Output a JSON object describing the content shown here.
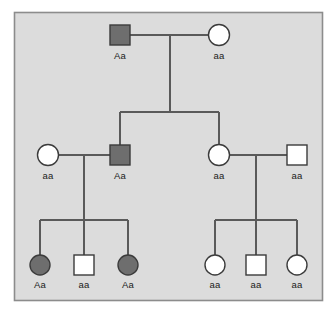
{
  "diagram": {
    "type": "pedigree",
    "frame": {
      "x": 14,
      "y": 12,
      "width": 308,
      "height": 288,
      "background_color": "#dcdcdc",
      "border_color": "#8c8c8c"
    },
    "colors": {
      "affected_fill": "#6e6e6e",
      "unaffected_fill": "#ffffff",
      "symbol_outline": "#3b3b3b",
      "line_color": "#5a5a5a",
      "label_color": "#1a1a1a"
    },
    "legend_note": "Filled symbol = affected (Aa shown shaded); open symbol = unaffected"
  },
  "generations": [
    {
      "id": "generation-1",
      "label": "I",
      "y": 35,
      "individuals": [
        {
          "id": "I-1",
          "sex": "male",
          "shape": "square",
          "affected": true,
          "genotype": "Aa",
          "x": 120,
          "y": 35
        },
        {
          "id": "I-2",
          "sex": "female",
          "shape": "circle",
          "affected": false,
          "genotype": "aa",
          "x": 219,
          "y": 35
        }
      ]
    },
    {
      "id": "generation-2",
      "label": "II",
      "y": 155,
      "individuals": [
        {
          "id": "II-1",
          "sex": "female",
          "shape": "circle",
          "affected": false,
          "genotype": "aa",
          "x": 48,
          "y": 155
        },
        {
          "id": "II-2",
          "sex": "male",
          "shape": "square",
          "affected": true,
          "genotype": "Aa",
          "x": 120,
          "y": 155
        },
        {
          "id": "II-3",
          "sex": "female",
          "shape": "circle",
          "affected": false,
          "genotype": "aa",
          "x": 219,
          "y": 155
        },
        {
          "id": "II-4",
          "sex": "male",
          "shape": "square",
          "affected": false,
          "genotype": "aa",
          "x": 297,
          "y": 155
        }
      ]
    },
    {
      "id": "generation-3",
      "label": "III",
      "y": 265,
      "individuals": [
        {
          "id": "III-1",
          "sex": "female",
          "shape": "circle",
          "affected": true,
          "genotype": "Aa",
          "x": 40,
          "y": 265
        },
        {
          "id": "III-2",
          "sex": "male",
          "shape": "square",
          "affected": false,
          "genotype": "aa",
          "x": 84,
          "y": 265
        },
        {
          "id": "III-3",
          "sex": "female",
          "shape": "circle",
          "affected": true,
          "genotype": "Aa",
          "x": 128,
          "y": 265
        },
        {
          "id": "III-4",
          "sex": "female",
          "shape": "circle",
          "affected": false,
          "genotype": "aa",
          "x": 215,
          "y": 265
        },
        {
          "id": "III-5",
          "sex": "male",
          "shape": "square",
          "affected": false,
          "genotype": "aa",
          "x": 256,
          "y": 265
        },
        {
          "id": "III-6",
          "sex": "female",
          "shape": "circle",
          "affected": false,
          "genotype": "aa",
          "x": 297,
          "y": 265
        }
      ]
    }
  ],
  "matings": [
    {
      "id": "mating-1",
      "partners": [
        "I-1",
        "I-2"
      ],
      "line_y": 35,
      "x1": 130,
      "x2": 210,
      "drop_x": 170,
      "drop_to_y": 112,
      "sibship_y": 112,
      "sibship_x1": 120,
      "sibship_x2": 219,
      "children": [
        "II-2",
        "II-3"
      ]
    },
    {
      "id": "mating-2",
      "partners": [
        "II-1",
        "II-2"
      ],
      "line_y": 155,
      "x1": 57,
      "x2": 110,
      "drop_x": 84,
      "drop_to_y": 220,
      "sibship_y": 220,
      "sibship_x1": 40,
      "sibship_x2": 128,
      "children": [
        "III-1",
        "III-2",
        "III-3"
      ]
    },
    {
      "id": "mating-3",
      "partners": [
        "II-3",
        "II-4"
      ],
      "line_y": 155,
      "x1": 228,
      "x2": 288,
      "drop_x": 256,
      "drop_to_y": 220,
      "sibship_y": 220,
      "sibship_x1": 215,
      "sibship_x2": 297,
      "children": [
        "III-4",
        "III-5",
        "III-6"
      ]
    }
  ],
  "labels": {
    "gen1_male": "Aa",
    "gen1_female": "aa",
    "gen2_female_left": "aa",
    "gen2_male_left": "Aa",
    "gen2_female_right": "aa",
    "gen2_male_right": "aa",
    "gen3_child1": "Aa",
    "gen3_child2": "aa",
    "gen3_child3": "Aa",
    "gen3_child4": "aa",
    "gen3_child5": "aa",
    "gen3_child6": "aa"
  }
}
